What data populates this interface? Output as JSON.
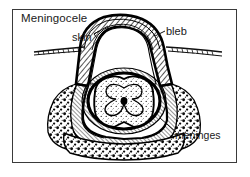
{
  "figure": {
    "title": "Meningocele",
    "type": "medical cross-section illustration",
    "frame": {
      "visible": true,
      "color": "#3a3a3a"
    },
    "labels": [
      {
        "id": "title",
        "text": "Meningocele",
        "leader": false
      },
      {
        "id": "skin",
        "text": "skin",
        "leader": true
      },
      {
        "id": "bleb",
        "text": "bleb",
        "leader": true
      },
      {
        "id": "meninges",
        "text": "meninges",
        "leader": true
      }
    ],
    "structures": [
      {
        "name": "skin-surface",
        "style": "thin-hatched-line"
      },
      {
        "name": "protruding-sac",
        "style": "dome-thick-outline"
      },
      {
        "name": "sac-cavity-csf",
        "style": "white-fill"
      },
      {
        "name": "meningeal-layers",
        "style": "diagonal-hatch"
      },
      {
        "name": "vertebral-bone",
        "style": "stipple-speckle"
      },
      {
        "name": "spinal-cord",
        "style": "stipple-oval"
      },
      {
        "name": "gray-matter",
        "style": "butterfly"
      },
      {
        "name": "central-canal",
        "style": "dark-dot"
      }
    ],
    "colors": {
      "ink": "#000000",
      "frame": "#3a3a3a",
      "paper": "#ffffff",
      "hatch": "#2b2b2b"
    }
  }
}
